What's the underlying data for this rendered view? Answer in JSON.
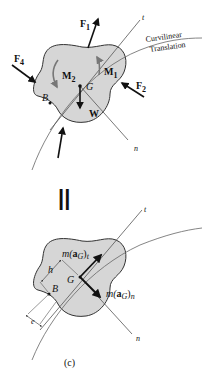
{
  "colors": {
    "body_fill": "#d6d6d6",
    "outline": "#333333",
    "line": "#555555",
    "arrow": "#111111",
    "moment_arrow": "#777777"
  },
  "top_fbd": {
    "forces": {
      "f1": "F",
      "f1_sub": "1",
      "f2": "F",
      "f2_sub": "2",
      "f4": "F",
      "f4_sub": "4",
      "weight": "W"
    },
    "moments": {
      "m1": "M",
      "m1_sub": "1",
      "m2": "M",
      "m2_sub": "2"
    },
    "points": {
      "g": "G",
      "b": "B"
    },
    "axes": {
      "t": "t",
      "n": "n"
    },
    "path_label_line1": "Curvilinear",
    "path_label_line2": "Translation"
  },
  "equals_sign": "||",
  "bottom_kd": {
    "vectors": {
      "mat_prefix": "m(",
      "mat_a": "a",
      "mat_sub": "G",
      "mat_close": ")",
      "mat_t_sub": "t",
      "man_n_sub": "n"
    },
    "points": {
      "g": "G",
      "b": "B"
    },
    "dimensions": {
      "h": "h",
      "e": "e"
    },
    "axes": {
      "t": "t",
      "n": "n"
    }
  },
  "caption": "(c)"
}
